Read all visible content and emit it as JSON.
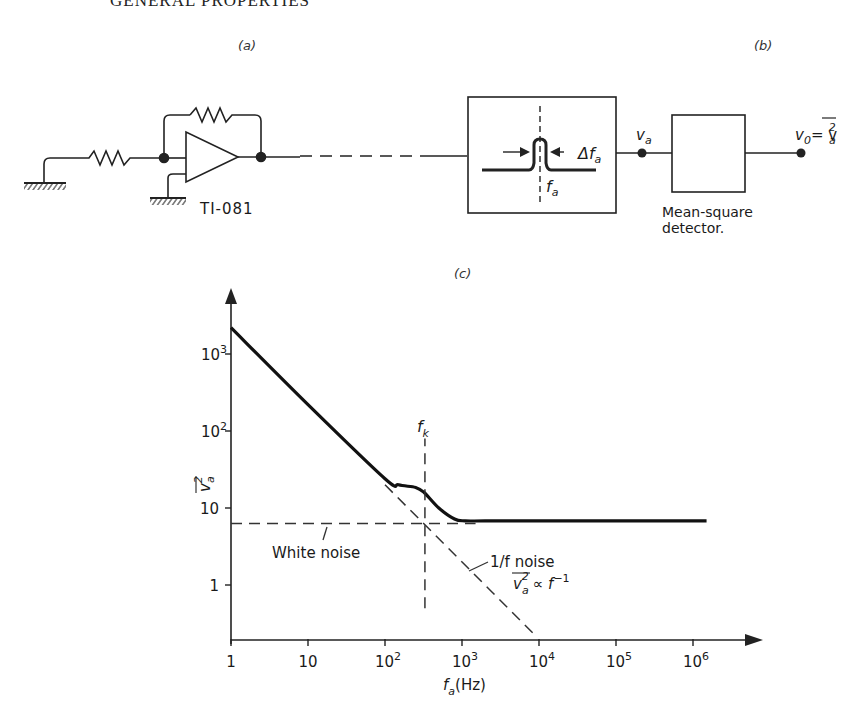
{
  "header": {
    "title": "GENERAL PROPERTIES"
  },
  "panels": {
    "a": "(a)",
    "b": "(b)",
    "c": "(c)"
  },
  "circuit": {
    "opamp_label": "TI-081",
    "filter": {
      "bandwidth_label": "Δf",
      "bandwidth_sub": "a",
      "center_label": "f",
      "center_sub": "a"
    },
    "node_va": {
      "label": "v",
      "sub": "a"
    },
    "detector": {
      "line1": "Mean-square",
      "line2": "detector."
    },
    "output": {
      "label": "v",
      "sub": "0",
      "eq": "= v",
      "eq_sub": "a",
      "eq_sup": "2"
    }
  },
  "chart_data": {
    "type": "line",
    "title": "",
    "xlabel": "f_a (Hz)",
    "ylabel": "v_a^2 (mean square)",
    "xscale": "log",
    "yscale": "log",
    "xlim": [
      1,
      1000000
    ],
    "ylim": [
      0.22,
      5000
    ],
    "x_ticks": [
      "1",
      "10",
      "10²",
      "10³",
      "10⁴",
      "10⁵",
      "10⁶"
    ],
    "x_tick_values": [
      1,
      10,
      100,
      1000,
      10000,
      100000,
      1000000
    ],
    "y_ticks": [
      "1",
      "10",
      "10²",
      "10³"
    ],
    "y_tick_values": [
      1,
      10,
      100,
      1000
    ],
    "series": [
      {
        "name": "total noise",
        "style": "solid",
        "x": [
          1,
          10,
          100,
          150,
          250,
          320,
          500,
          800,
          1100,
          2000,
          10000,
          100000,
          1500000
        ],
        "y": [
          2200,
          220,
          24,
          20,
          18.5,
          16,
          10,
          7.2,
          6.8,
          6.8,
          6.8,
          6.8,
          6.8
        ]
      },
      {
        "name": "White noise",
        "style": "dashed",
        "x": [
          1,
          1500
        ],
        "y": [
          6.3,
          6.3
        ]
      },
      {
        "name": "1/f noise",
        "style": "dashed",
        "x": [
          100,
          9000
        ],
        "y": [
          20,
          0.22
        ]
      },
      {
        "name": "f_k marker",
        "style": "dashed",
        "x": [
          330,
          330
        ],
        "y": [
          0.5,
          80
        ]
      }
    ],
    "annotations": {
      "white_noise": "White noise",
      "one_over_f": "1/f noise",
      "prop_lhs": "v",
      "prop_sub": "a",
      "prop_sup": "2",
      "prop_rhs": "∝ f",
      "prop_exp": "−1",
      "fk": "f",
      "fk_sub": "k",
      "fk_value": 330
    },
    "xlabel_main": "f",
    "xlabel_sub": "a",
    "xlabel_unit": "(Hz)",
    "ylabel_main": "v",
    "ylabel_sub": "a",
    "ylabel_sup": "2"
  }
}
